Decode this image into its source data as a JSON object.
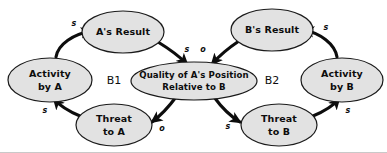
{
  "diagram": {
    "type": "causal-loop-diagram",
    "colors": {
      "node_fill": "#e2e2e2",
      "node_stroke": "#1a1a1a",
      "arrow": "#0d0d0d",
      "background": "#ffffff"
    },
    "nodes": [
      {
        "id": "activity-a",
        "label_line1": "Activity",
        "label_line2": "by A",
        "cx": 50,
        "cy": 80,
        "rx": 42,
        "ry": 22
      },
      {
        "id": "a-result",
        "label_line1": "A's Result",
        "label_line2": "",
        "cx": 123,
        "cy": 32,
        "rx": 41,
        "ry": 21
      },
      {
        "id": "threat-a",
        "label_line1": "Threat",
        "label_line2": "to A",
        "cx": 114,
        "cy": 125,
        "rx": 38,
        "ry": 21
      },
      {
        "id": "quality-center",
        "label_line1": "Quality of A's Position",
        "label_line2": "Relative to B",
        "cx": 194,
        "cy": 81,
        "rx": 63,
        "ry": 19
      },
      {
        "id": "b-result",
        "label_line1": "B's Result",
        "label_line2": "",
        "cx": 272,
        "cy": 30,
        "rx": 41,
        "ry": 21
      },
      {
        "id": "threat-b",
        "label_line1": "Threat",
        "label_line2": "to B",
        "cx": 279,
        "cy": 125,
        "rx": 38,
        "ry": 21
      },
      {
        "id": "activity-b",
        "label_line1": "Activity",
        "label_line2": "by B",
        "cx": 342,
        "cy": 80,
        "rx": 41,
        "ry": 22
      }
    ],
    "loops": [
      {
        "id": "loop-b1",
        "label": "B1",
        "x": 114,
        "y": 81
      },
      {
        "id": "loop-b2",
        "label": "B2",
        "x": 272,
        "y": 81
      }
    ],
    "links": [
      {
        "id": "activity-a-to-a-result",
        "from": "activity-a",
        "to": "a-result",
        "polarity": "s",
        "label_x": 74,
        "label_y": 23
      },
      {
        "id": "a-result-to-quality",
        "from": "a-result",
        "to": "quality-center",
        "polarity": "s",
        "label_x": 187,
        "label_y": 49
      },
      {
        "id": "quality-to-threat-a",
        "from": "quality-center",
        "to": "threat-a",
        "polarity": "o",
        "label_x": 162,
        "label_y": 128
      },
      {
        "id": "threat-a-to-activity-a",
        "from": "threat-a",
        "to": "activity-a",
        "polarity": "s",
        "label_x": 45,
        "label_y": 110
      },
      {
        "id": "b-result-to-quality",
        "from": "b-result",
        "to": "quality-center",
        "polarity": "o",
        "label_x": 203,
        "label_y": 49
      },
      {
        "id": "quality-to-threat-b",
        "from": "quality-center",
        "to": "threat-b",
        "polarity": "s",
        "label_x": 228,
        "label_y": 126
      },
      {
        "id": "threat-b-to-activity-b",
        "from": "threat-b",
        "to": "activity-b",
        "polarity": "s",
        "label_x": 348,
        "label_y": 110
      },
      {
        "id": "activity-b-to-b-result",
        "from": "activity-b",
        "to": "b-result",
        "polarity": "s",
        "label_x": 326,
        "label_y": 27
      }
    ]
  }
}
